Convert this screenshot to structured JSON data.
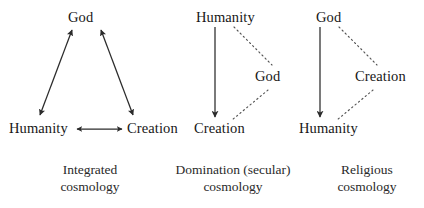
{
  "figure": {
    "background_color": "#ffffff",
    "ink_color": "#1a1a1a",
    "solid_line_color": "#2b2b2b",
    "dotted_line_color": "#555555",
    "diagrams": [
      {
        "id": "integrated-cosmology",
        "caption_line1": "Integrated",
        "caption_line2": "cosmology",
        "nodes": {
          "top": "God",
          "bottom_left": "Humanity",
          "bottom_right": "Creation"
        },
        "edges": [
          {
            "from": "Humanity",
            "to": "God",
            "style": "solid",
            "arrows": "both"
          },
          {
            "from": "God",
            "to": "Creation",
            "style": "solid",
            "arrows": "both"
          },
          {
            "from": "Humanity",
            "to": "Creation",
            "style": "solid",
            "arrows": "both"
          }
        ]
      },
      {
        "id": "domination-secular-cosmology",
        "caption_line1": "Domination (secular)",
        "caption_line2": "cosmology",
        "nodes": {
          "top": "Humanity",
          "bottom": "Creation",
          "right": "God"
        },
        "edges": [
          {
            "from": "Humanity",
            "to": "Creation",
            "style": "solid",
            "arrows": "end"
          },
          {
            "from": "Humanity",
            "to": "God",
            "style": "dotted",
            "arrows": "none"
          },
          {
            "from": "God",
            "to": "Creation",
            "style": "dotted",
            "arrows": "none"
          }
        ]
      },
      {
        "id": "religious-cosmology",
        "caption_line1": "Religious",
        "caption_line2": "cosmology",
        "nodes": {
          "top": "God",
          "bottom": "Humanity",
          "right": "Creation"
        },
        "edges": [
          {
            "from": "God",
            "to": "Humanity",
            "style": "solid",
            "arrows": "end"
          },
          {
            "from": "God",
            "to": "Creation",
            "style": "dotted",
            "arrows": "none"
          },
          {
            "from": "Creation",
            "to": "Humanity",
            "style": "dotted",
            "arrows": "none"
          }
        ]
      }
    ]
  }
}
